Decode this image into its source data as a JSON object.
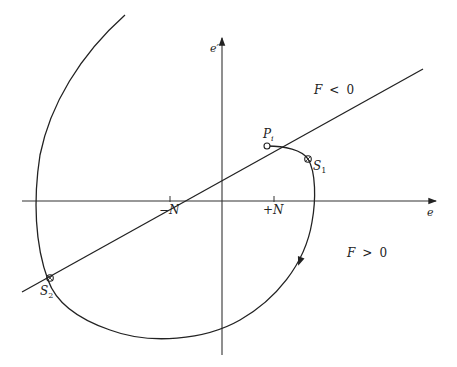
{
  "diagram": {
    "type": "phase-plane",
    "axes": {
      "x_label": "e",
      "y_label": "e′",
      "ticks": [
        {
          "label_sign": "−",
          "label_var": "N",
          "position": "negative"
        },
        {
          "label_sign": "+",
          "label_var": "N",
          "position": "positive"
        }
      ]
    },
    "regions": [
      {
        "label_var": "F",
        "label_op": "<",
        "label_val": "0",
        "side": "above switching line"
      },
      {
        "label_var": "F",
        "label_op": ">",
        "label_val": "0",
        "side": "below switching line"
      }
    ],
    "points": [
      {
        "name": "P",
        "subscript": "i",
        "role": "initial point"
      },
      {
        "name": "S",
        "subscript": "1",
        "role": "first switching point"
      },
      {
        "name": "S",
        "subscript": "2",
        "role": "second switching point"
      }
    ],
    "curves": [
      {
        "name": "switching-line",
        "description": "straight line through origin F = 0"
      },
      {
        "name": "trajectory",
        "description": "spiral trajectory starting at P_i, crossing S_1 then S_2, with direction arrow"
      }
    ]
  }
}
